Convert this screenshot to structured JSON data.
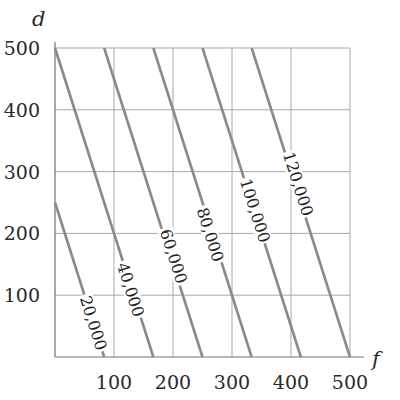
{
  "chart_data": {
    "type": "line",
    "title": "",
    "subtitle": "",
    "xlabel": "f",
    "ylabel": "d",
    "xlim": [
      0,
      500
    ],
    "ylim": [
      0,
      500
    ],
    "grid": true,
    "legend": "none (inline contour labels)",
    "x_ticks": [
      100,
      200,
      300,
      400,
      500
    ],
    "y_ticks": [
      100,
      200,
      300,
      400,
      500
    ],
    "x_tick_labels": [
      "100",
      "200",
      "300",
      "400",
      "500"
    ],
    "y_tick_labels": [
      "100",
      "200",
      "300",
      "400",
      "500"
    ],
    "series": [
      {
        "name": "20,000",
        "label": "20,000",
        "value": 20000,
        "points": [
          [
            0,
            250
          ],
          [
            83.3,
            0
          ]
        ]
      },
      {
        "name": "40,000",
        "label": "40,000",
        "value": 40000,
        "points": [
          [
            0,
            500
          ],
          [
            166.7,
            0
          ]
        ]
      },
      {
        "name": "60,000",
        "label": "60,000",
        "value": 60000,
        "points": [
          [
            83.3,
            500
          ],
          [
            250,
            0
          ]
        ]
      },
      {
        "name": "80,000",
        "label": "80,000",
        "value": 80000,
        "points": [
          [
            166.7,
            500
          ],
          [
            333.3,
            0
          ]
        ]
      },
      {
        "name": "100,000",
        "label": "100,000",
        "value": 100000,
        "points": [
          [
            250,
            500
          ],
          [
            416.7,
            0
          ]
        ]
      },
      {
        "name": "120,000",
        "label": "120,000",
        "value": 120000,
        "points": [
          [
            333.3,
            500
          ],
          [
            500,
            0
          ]
        ]
      }
    ],
    "annotations": [
      {
        "text": "20,000",
        "at": [
          65,
          55
        ]
      },
      {
        "text": "40,000",
        "at": [
          128,
          109
        ]
      },
      {
        "text": "60,000",
        "at": [
          201,
          163
        ]
      },
      {
        "text": "80,000",
        "at": [
          263,
          198
        ]
      },
      {
        "text": "100,000",
        "at": [
          339,
          237
        ]
      },
      {
        "text": "120,000",
        "at": [
          412,
          280
        ]
      }
    ]
  },
  "axes": {
    "x_title": "f",
    "y_title": "d"
  }
}
